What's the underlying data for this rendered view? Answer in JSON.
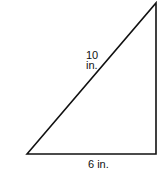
{
  "diagram": {
    "shape": "right triangle",
    "hypotenuse_label": {
      "value": "10",
      "unit": "in."
    },
    "base_label": "6 in.",
    "stroke_color": "#111111",
    "background": "#ffffff"
  }
}
